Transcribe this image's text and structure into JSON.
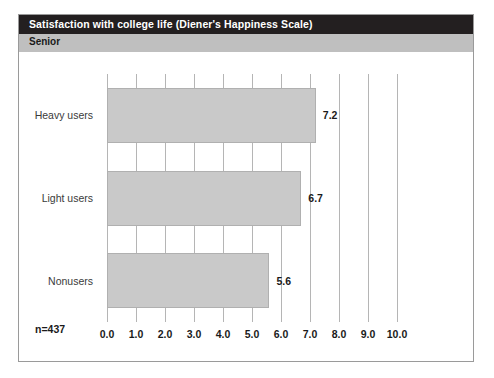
{
  "chart_data": {
    "type": "bar",
    "orientation": "horizontal",
    "title": "Satisfaction with college life (Diener's Happiness Scale)",
    "subtitle": "Senior",
    "categories": [
      "Heavy users",
      "Light users",
      "Nonusers"
    ],
    "values": [
      7.2,
      6.7,
      5.6
    ],
    "value_labels": [
      "7.2",
      "6.7",
      "5.6"
    ],
    "xlabel": "",
    "ylabel": "",
    "xlim": [
      0.0,
      10.0
    ],
    "xticks": [
      0.0,
      1.0,
      2.0,
      3.0,
      4.0,
      5.0,
      6.0,
      7.0,
      8.0,
      9.0,
      10.0
    ],
    "xtick_labels": [
      "0.0",
      "1.0",
      "2.0",
      "3.0",
      "4.0",
      "5.0",
      "6.0",
      "7.0",
      "8.0",
      "9.0",
      "10.0"
    ],
    "grid": "vertical",
    "legend": "none",
    "annotation": "n=437",
    "colors": {
      "bar_fill": "#c9c9c9",
      "bar_border": "#b0b0b0",
      "gridline": "#b5b5b5",
      "title_bg": "#231f20",
      "title_fg": "#ffffff",
      "subtitle_bg": "#bfbfbf",
      "subtitle_fg": "#1a1a1a",
      "frame_border": "#9a9a9a",
      "plot_bg": "#ffffff"
    }
  }
}
